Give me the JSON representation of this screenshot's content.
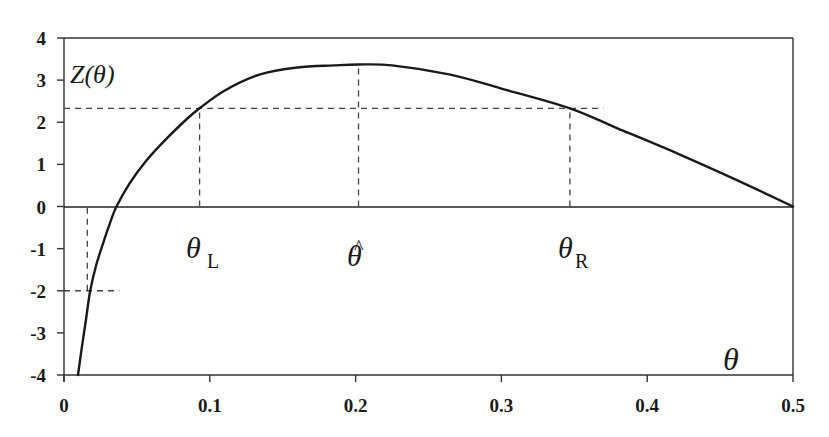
{
  "chart_data": {
    "type": "line",
    "title": "",
    "xlabel": "θ",
    "ylabel": "Z(θ)",
    "xlim": [
      0,
      0.5
    ],
    "ylim": [
      -4,
      4
    ],
    "grid": false,
    "legend": null,
    "x_ticks": [
      "0",
      "0.1",
      "0.2",
      "0.3",
      "0.4",
      "0.5"
    ],
    "y_ticks": [
      "4",
      "3",
      "2",
      "1",
      "0",
      "-1",
      "-2",
      "-3",
      "-4"
    ],
    "series": [
      {
        "name": "Z(θ)",
        "x": [
          0.0096,
          0.012,
          0.015,
          0.018,
          0.022,
          0.027,
          0.032,
          0.036,
          0.045,
          0.056,
          0.07,
          0.085,
          0.093,
          0.11,
          0.134,
          0.16,
          0.185,
          0.202,
          0.225,
          0.265,
          0.3,
          0.347,
          0.38,
          0.422,
          0.46,
          0.5
        ],
        "values": [
          -4.0,
          -3.4,
          -2.7,
          -2.0,
          -1.4,
          -0.85,
          -0.35,
          0.0,
          0.55,
          1.07,
          1.6,
          2.1,
          2.33,
          2.75,
          3.13,
          3.3,
          3.35,
          3.37,
          3.35,
          3.13,
          2.8,
          2.33,
          1.85,
          1.24,
          0.65,
          0.0
        ]
      }
    ],
    "reference_lines": [
      {
        "type": "horizontal",
        "y": 2.33,
        "x_from": 0,
        "x_to": 0.37,
        "style": "dashed"
      },
      {
        "type": "vertical",
        "x": 0.093,
        "y_from": 0,
        "y_to": 2.33,
        "style": "dashed",
        "label": "θ_L"
      },
      {
        "type": "vertical",
        "x": 0.202,
        "y_from": 0,
        "y_to": 3.37,
        "style": "dashed",
        "label": "θ̂"
      },
      {
        "type": "vertical",
        "x": 0.347,
        "y_from": 0,
        "y_to": 2.33,
        "style": "dashed",
        "label": "θ_R"
      },
      {
        "type": "vertical",
        "x": 0.016,
        "y_from": -2,
        "y_to": 0,
        "style": "dashed"
      },
      {
        "type": "horizontal",
        "y": -2,
        "x_from": 0,
        "x_to": 0.038,
        "style": "dashed"
      }
    ],
    "annotations": [
      {
        "text": "θL",
        "x": 0.093,
        "y": -1.7
      },
      {
        "text": "θ̂",
        "x": 0.202,
        "y": -1.7
      },
      {
        "text": "θR",
        "x": 0.347,
        "y": -1.7
      },
      {
        "text": "θ",
        "x": 0.455,
        "y": -3.2
      },
      {
        "text": "Z(θ)",
        "x": 0.01,
        "y": 3.2
      }
    ]
  },
  "labels": {
    "y_axis_title": "Z(θ)",
    "x_axis_title": "θ",
    "theta_L_main": "θ",
    "theta_L_sub": "L",
    "theta_hat": "θ",
    "theta_hat_accent": "^",
    "theta_R_main": "θ",
    "theta_R_sub": "R"
  }
}
